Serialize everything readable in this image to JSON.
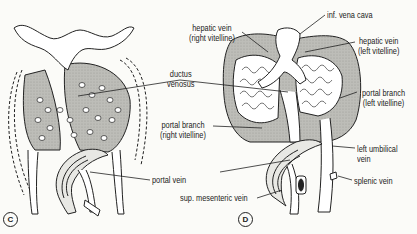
{
  "panels": [
    {
      "id": "C",
      "labels": {
        "ductus_venosus_1": "ductus",
        "ductus_venosus_2": "venosus",
        "portal_vein": "portal vein"
      }
    },
    {
      "id": "D",
      "labels": {
        "inf_vena_cava": "inf. vena cava",
        "hepatic_vein_right_1": "hepatic vein",
        "hepatic_vein_right_2": "(right vitelline)",
        "hepatic_vein_left_1": "hepatic vein",
        "hepatic_vein_left_2": "(left vitelline)",
        "portal_branch_left_1": "portal branch",
        "portal_branch_left_2": "(left vitelline)",
        "portal_branch_right_1": "portal branch",
        "portal_branch_right_2": "(right vitelline)",
        "left_umbilical_1": "left umbilical",
        "left_umbilical_2": "vein",
        "splenic_vein": "splenic vein",
        "sup_mesenteric_vein": "sup. mesenteric vein"
      }
    }
  ],
  "colors": {
    "ink": "#222222",
    "tissue": "#b9b9b4",
    "background": "#fbfbf8"
  }
}
